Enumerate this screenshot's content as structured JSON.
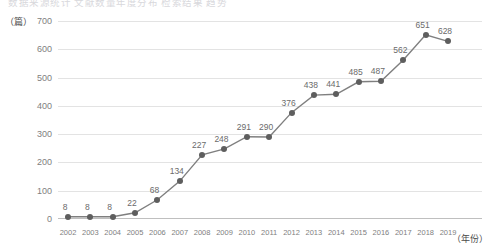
{
  "title_partial": "数据来源统计 文献数量年度分布 检索结果 趋势",
  "axes": {
    "y_unit_label": "（篇）",
    "x_unit_label": "（年份）",
    "y_ticks": [
      700,
      600,
      500,
      400,
      300,
      200,
      100,
      0
    ]
  },
  "style": {
    "line_color": "#7f7f7f",
    "marker_color": "#5e5e5e",
    "grid_color": "#e3e3e3",
    "label_color": "#6b6b6b"
  },
  "chart_data": {
    "type": "line",
    "title": "",
    "xlabel": "（年份）",
    "ylabel": "（篇）",
    "ylim": [
      0,
      700
    ],
    "grid": true,
    "legend": "none",
    "categories": [
      "2002",
      "2003",
      "2004",
      "2005",
      "2006",
      "2007",
      "2008",
      "2009",
      "2010",
      "2011",
      "2012",
      "2013",
      "2014",
      "2015",
      "2016",
      "2017",
      "2018",
      "2019"
    ],
    "values": [
      8,
      8,
      8,
      22,
      68,
      134,
      227,
      248,
      291,
      290,
      376,
      438,
      441,
      485,
      487,
      562,
      651,
      628
    ],
    "series": [
      {
        "name": "文献数量",
        "values": [
          8,
          8,
          8,
          22,
          68,
          134,
          227,
          248,
          291,
          290,
          376,
          438,
          441,
          485,
          487,
          562,
          651,
          628
        ]
      }
    ],
    "data_labels": [
      "8",
      "8",
      "8",
      "22",
      "68",
      "134",
      "227",
      "248",
      "291",
      "290",
      "376",
      "438",
      "441",
      "485",
      "487",
      "562",
      "651",
      "628"
    ]
  }
}
